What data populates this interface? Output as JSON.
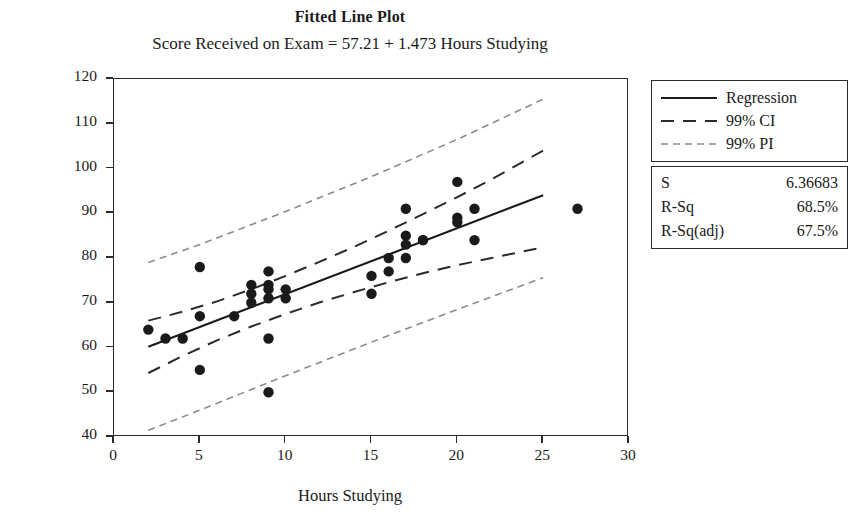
{
  "header": {
    "title": "Fitted Line Plot",
    "subtitle": "Score Received on Exam =  57.21 + 1.473 Hours Studying"
  },
  "legend": {
    "items": [
      {
        "label": "Regression",
        "key": "solid-line-key"
      },
      {
        "label": "99% CI",
        "key": "dashed-line-key"
      },
      {
        "label": "99% PI",
        "key": "dotted-line-key"
      }
    ]
  },
  "stats": {
    "rows": [
      {
        "name": "S",
        "value": "6.36683"
      },
      {
        "name": "R-Sq",
        "value": "68.5%"
      },
      {
        "name": "R-Sq(adj)",
        "value": "67.5%"
      }
    ]
  },
  "colors": {
    "axis": "#2b2b2b",
    "marker": "#1a1a1a",
    "regression": "#1a1a1a",
    "ci": "#2b2b2b",
    "pi": "#8c8c8c"
  },
  "chart_data": {
    "type": "scatter",
    "title": "Fitted Line Plot",
    "subtitle": "Score Received on Exam =  57.21 + 1.473 Hours Studying",
    "xlabel": "Hours Studying",
    "ylabel": "Score Received on Exam",
    "xlim": [
      0,
      30
    ],
    "ylim": [
      40,
      120
    ],
    "xticks": [
      0,
      5,
      10,
      15,
      20,
      25,
      30
    ],
    "yticks": [
      40,
      50,
      60,
      70,
      80,
      90,
      100,
      110,
      120
    ],
    "grid": false,
    "legend_position": "right-top",
    "regression": {
      "intercept": 57.21,
      "slope": 1.473,
      "x_start": 2,
      "x_end": 25,
      "label": "Regression"
    },
    "s": 6.36683,
    "r_sq": 68.5,
    "r_sq_adj": 67.5,
    "ci_level": 99,
    "pi_level": 99,
    "ci_band": {
      "label": "99% CI",
      "x": [
        2,
        4,
        6,
        8,
        10,
        12,
        14,
        16,
        18,
        20,
        22,
        25
      ],
      "upper": [
        66.0,
        68.0,
        70.3,
        73.0,
        76.0,
        79.2,
        82.5,
        86.1,
        89.8,
        93.6,
        97.6,
        104.0
      ],
      "lower": [
        54.3,
        58.1,
        61.6,
        64.7,
        67.5,
        70.1,
        72.4,
        74.6,
        76.6,
        78.4,
        80.0,
        82.4
      ]
    },
    "pi_band": {
      "label": "99% PI",
      "x": [
        2,
        5,
        10,
        15,
        20,
        25
      ],
      "upper": [
        79.0,
        83.0,
        90.4,
        98.2,
        106.5,
        115.5
      ],
      "lower": [
        41.5,
        46.0,
        53.7,
        61.2,
        68.5,
        75.6
      ]
    },
    "points": [
      {
        "x": 2,
        "y": 64
      },
      {
        "x": 3,
        "y": 62
      },
      {
        "x": 4,
        "y": 62
      },
      {
        "x": 5,
        "y": 67
      },
      {
        "x": 5,
        "y": 78
      },
      {
        "x": 5,
        "y": 55
      },
      {
        "x": 7,
        "y": 67
      },
      {
        "x": 8,
        "y": 72
      },
      {
        "x": 8,
        "y": 74
      },
      {
        "x": 8,
        "y": 70
      },
      {
        "x": 9,
        "y": 77
      },
      {
        "x": 9,
        "y": 74
      },
      {
        "x": 9,
        "y": 73
      },
      {
        "x": 9,
        "y": 71
      },
      {
        "x": 9,
        "y": 62
      },
      {
        "x": 9,
        "y": 50
      },
      {
        "x": 10,
        "y": 73
      },
      {
        "x": 10,
        "y": 71
      },
      {
        "x": 15,
        "y": 76
      },
      {
        "x": 15,
        "y": 72
      },
      {
        "x": 16,
        "y": 80
      },
      {
        "x": 16,
        "y": 77
      },
      {
        "x": 17,
        "y": 83
      },
      {
        "x": 17,
        "y": 85
      },
      {
        "x": 17,
        "y": 91
      },
      {
        "x": 17,
        "y": 80
      },
      {
        "x": 18,
        "y": 84
      },
      {
        "x": 18,
        "y": 84
      },
      {
        "x": 20,
        "y": 97
      },
      {
        "x": 20,
        "y": 89
      },
      {
        "x": 20,
        "y": 88
      },
      {
        "x": 21,
        "y": 91
      },
      {
        "x": 21,
        "y": 84
      },
      {
        "x": 27,
        "y": 91
      }
    ]
  }
}
